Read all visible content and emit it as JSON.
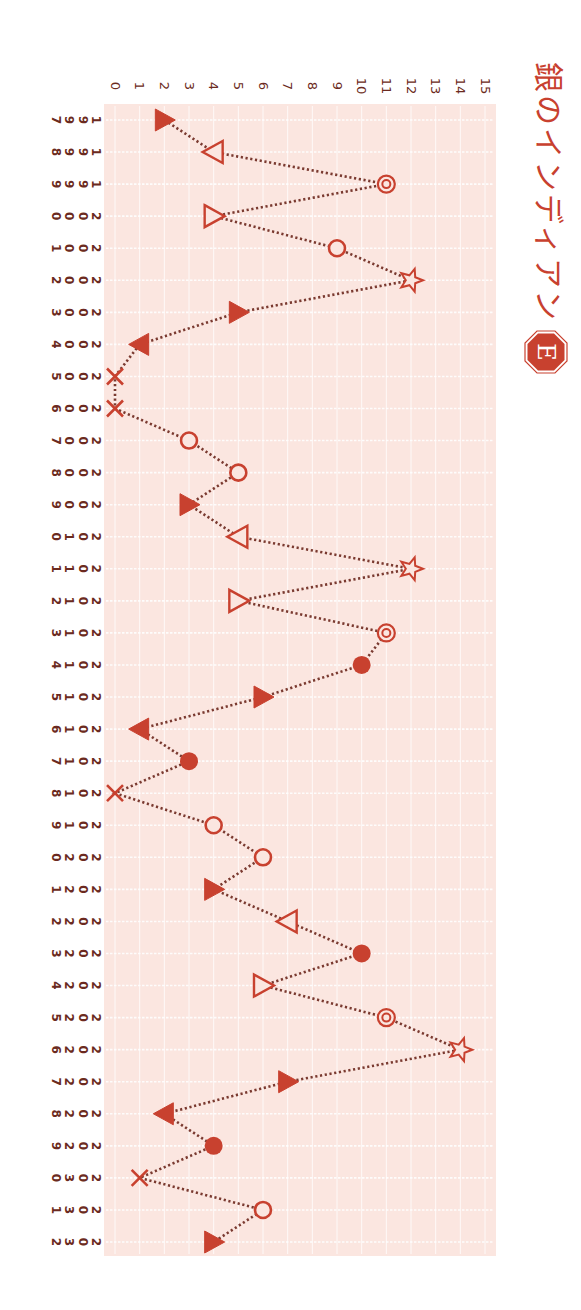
{
  "title": "銀のインディアン",
  "badge": "E",
  "colors": {
    "accent": "#c8412f",
    "plot_bg": "#fbe6e0",
    "grid": "#ffffff",
    "axis_text": "#6b2a20",
    "line": "#7a3a30"
  },
  "chart_data": {
    "type": "line",
    "title": "銀のインディアン",
    "orientation": "rotated-90-clockwise",
    "xlabel": "",
    "ylabel": "",
    "ylim": [
      0,
      15
    ],
    "yticks": [
      0,
      1,
      2,
      3,
      4,
      5,
      6,
      7,
      8,
      9,
      10,
      11,
      12,
      13,
      14,
      15
    ],
    "grid": true,
    "legend": null,
    "line_style": "dotted",
    "categories": [
      "1997",
      "1998",
      "1999",
      "2000",
      "2001",
      "2002",
      "2003",
      "2004",
      "2005",
      "2006",
      "2007",
      "2008",
      "2009",
      "2010",
      "2011",
      "2012",
      "2013",
      "2014",
      "2015",
      "2016",
      "2017",
      "2018",
      "2019",
      "2020",
      "2021",
      "2022",
      "2023",
      "2024",
      "2025",
      "2026",
      "2027",
      "2028",
      "2029",
      "2030",
      "2031",
      "2032"
    ],
    "values": [
      2,
      4,
      11,
      4,
      9,
      12,
      5,
      1,
      0,
      0,
      3,
      5,
      3,
      5,
      12,
      5,
      11,
      10,
      6,
      1,
      3,
      0,
      4,
      6,
      4,
      7,
      10,
      6,
      11,
      14,
      7,
      2,
      4,
      1,
      6,
      4
    ],
    "markers": [
      "tri-right-filled",
      "tri-left-open",
      "double-circle",
      "tri-right-open",
      "circle-open",
      "star-open",
      "tri-right-filled",
      "tri-left-filled",
      "cross",
      "cross",
      "circle-open",
      "circle-open",
      "tri-right-filled",
      "tri-left-open",
      "star-open",
      "tri-right-open",
      "double-circle",
      "circle-filled",
      "tri-right-filled",
      "tri-left-filled",
      "circle-filled",
      "cross",
      "circle-open",
      "circle-open",
      "tri-right-filled",
      "tri-left-open",
      "circle-filled",
      "tri-right-open",
      "double-circle",
      "star-open",
      "tri-right-filled",
      "tri-left-filled",
      "circle-filled",
      "cross",
      "circle-open",
      "tri-right-filled"
    ]
  }
}
